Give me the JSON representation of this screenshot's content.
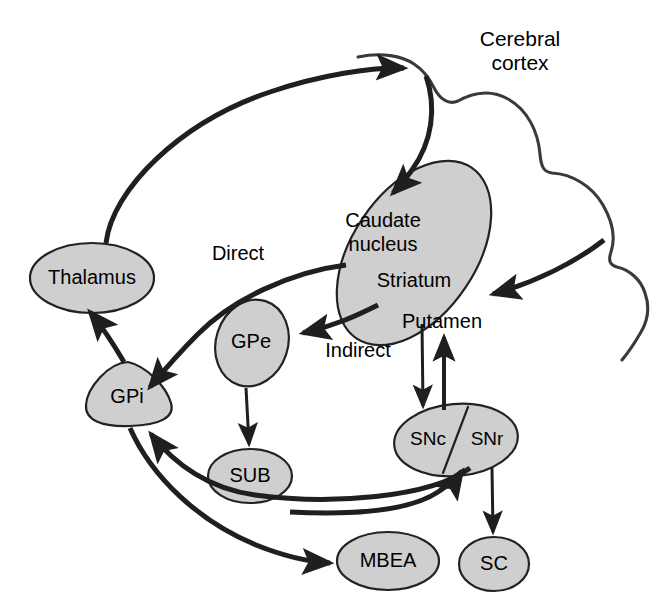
{
  "figure": {
    "title_label": "Cerebral cortex",
    "title_line1": "Cerebral",
    "title_line2": "cortex",
    "background_color": "#ffffff",
    "node_fill_color": "#cfcfcf",
    "node_stroke_color": "#222222",
    "connector_color": "#1f1f1f",
    "cortex_outline_color": "#3a3a3a"
  },
  "nodes": [
    {
      "id": "cortex",
      "label": "Cerebral cortex",
      "shape": "lobed-outline"
    },
    {
      "id": "striatum",
      "label": "Striatum",
      "shape": "tilted-ellipse"
    },
    {
      "id": "caudate",
      "label": "Caudate nucleus",
      "label_line1": "Caudate",
      "label_line2": "nucleus",
      "shape": "region-of-striatum"
    },
    {
      "id": "putamen",
      "label": "Putamen",
      "shape": "region-of-striatum"
    },
    {
      "id": "thalamus",
      "label": "Thalamus",
      "shape": "ellipse"
    },
    {
      "id": "gpe",
      "label": "GPe",
      "shape": "tilted-ellipse"
    },
    {
      "id": "gpi",
      "label": "GPi",
      "shape": "rounded-triangle"
    },
    {
      "id": "sub",
      "label": "SUB",
      "shape": "ellipse"
    },
    {
      "id": "snc",
      "label": "SNc",
      "shape": "half-ellipse"
    },
    {
      "id": "snr",
      "label": "SNr",
      "shape": "half-ellipse"
    },
    {
      "id": "mbea",
      "label": "MBEA",
      "shape": "ellipse"
    },
    {
      "id": "sc",
      "label": "SC",
      "shape": "ellipse"
    }
  ],
  "pathway_labels": [
    {
      "id": "direct",
      "label": "Direct"
    },
    {
      "id": "indirect",
      "label": "Indirect"
    }
  ],
  "connections": [
    {
      "id": "thalamus-to-cortex",
      "from": "thalamus",
      "to": "cortex",
      "style": "curved-arrow"
    },
    {
      "id": "cortex-to-caudate",
      "from": "cortex",
      "to": "caudate",
      "style": "curved-arrow"
    },
    {
      "id": "cortex-to-putamen",
      "from": "cortex",
      "to": "putamen",
      "style": "curved-arrow"
    },
    {
      "id": "striatum-to-gpi",
      "from": "striatum",
      "to": "gpi",
      "style": "curved-arrow",
      "pathway": "Direct"
    },
    {
      "id": "striatum-to-gpe",
      "from": "striatum",
      "to": "gpe",
      "style": "curved-arrow",
      "pathway": "Indirect"
    },
    {
      "id": "gpe-to-sub",
      "from": "gpe",
      "to": "sub",
      "style": "straight-arrow"
    },
    {
      "id": "putamen-to-snc",
      "from": "putamen",
      "to": "snc",
      "style": "straight-arrow"
    },
    {
      "id": "snc-to-putamen",
      "from": "snc",
      "to": "putamen",
      "style": "straight-arrow"
    },
    {
      "id": "gpi-to-thalamus",
      "from": "gpi",
      "to": "thalamus",
      "style": "curved-arrow"
    },
    {
      "id": "snr-to-gpi",
      "from": "snr",
      "to": "gpi",
      "style": "curved-arrow"
    },
    {
      "id": "gpi-to-mbea",
      "from": "gpi",
      "to": "mbea",
      "style": "curved-arrow"
    },
    {
      "id": "mbea-to-snr",
      "from": "mbea",
      "to": "snr",
      "style": "curved-arrow"
    },
    {
      "id": "snr-to-sc",
      "from": "snr",
      "to": "sc",
      "style": "straight-arrow"
    }
  ]
}
